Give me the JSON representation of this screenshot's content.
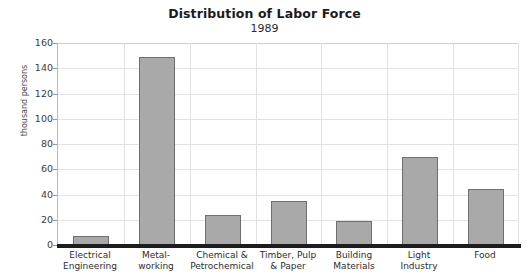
{
  "chart_data": {
    "type": "bar",
    "title": "Distribution of Labor Force",
    "subtitle": "1989",
    "xlabel": "",
    "ylabel": "thousand persons",
    "ylim": [
      0,
      160
    ],
    "ytick_step": 20,
    "yticks": [
      0,
      20,
      40,
      60,
      80,
      100,
      120,
      140,
      160
    ],
    "grid": true,
    "legend": "none",
    "bar_color": "#a9a9a9",
    "bar_border_color": "#6f6f6f",
    "categories": [
      "Electrical\nEngineering",
      "Metal-\nworking",
      "Chemical &\nPetrochemical",
      "Timber, Pulp\n& Paper",
      "Building\nMaterials",
      "Light\nIndustry",
      "Food"
    ],
    "categories_flat": [
      "Electrical Engineering",
      "Metal-working",
      "Chemical & Petrochemical",
      "Timber, Pulp & Paper",
      "Building Materials",
      "Light Industry",
      "Food"
    ],
    "category_lines": [
      [
        "Electrical",
        "Engineering"
      ],
      [
        "Metal-",
        "working"
      ],
      [
        "Chemical &",
        "Petrochemical"
      ],
      [
        "Timber, Pulp",
        "& Paper"
      ],
      [
        "Building",
        "Materials"
      ],
      [
        "Light",
        "Industry"
      ],
      [
        "Food",
        ""
      ]
    ],
    "values": [
      7,
      149,
      24,
      35,
      19,
      70,
      44
    ]
  }
}
